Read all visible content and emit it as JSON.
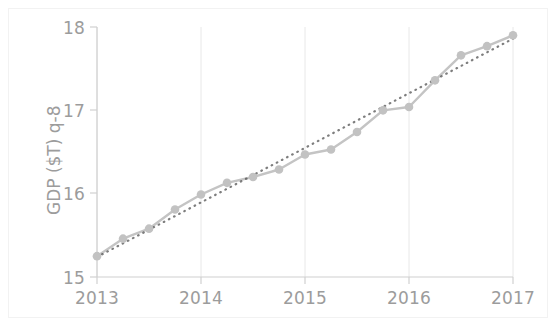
{
  "chart_data": {
    "type": "line",
    "title": "",
    "xlabel": "",
    "ylabel": "GDP ($T) q-8",
    "xlim": [
      2013.0,
      2017.0
    ],
    "ylim": [
      15.0,
      18.0
    ],
    "xticks": [
      "2013",
      "2014",
      "2015",
      "2016",
      "2017"
    ],
    "xtick_values": [
      2013,
      2014,
      2015,
      2016,
      2017
    ],
    "yticks": [
      "15",
      "16",
      "17",
      "18"
    ],
    "ytick_values": [
      15,
      16,
      17,
      18
    ],
    "grid": true,
    "grid_axis": "x",
    "legend": "none",
    "series": [
      {
        "name": "GDP",
        "style": "solid-line-with-markers",
        "color": "#c4c4c4",
        "marker": "circle",
        "x": [
          2013.0,
          2013.25,
          2013.5,
          2013.75,
          2014.0,
          2014.25,
          2014.5,
          2014.75,
          2015.0,
          2015.25,
          2015.5,
          2015.75,
          2016.0,
          2016.25,
          2016.5,
          2016.75,
          2017.0
        ],
        "values": [
          15.25,
          15.46,
          15.58,
          15.81,
          15.99,
          16.13,
          16.2,
          16.29,
          16.47,
          16.53,
          16.74,
          17.0,
          17.04,
          17.36,
          17.66,
          17.77,
          17.9
        ]
      },
      {
        "name": "Trend",
        "style": "dotted-line",
        "color": "#4d4d4d",
        "marker": "none",
        "x": [
          2013.0,
          2017.0
        ],
        "values": [
          15.24,
          17.86
        ]
      }
    ]
  },
  "axis": {
    "y_label": "GDP ($T) q-8",
    "y_tick_labels": [
      "18",
      "17",
      "16",
      "15"
    ],
    "x_tick_labels": [
      "2013",
      "2014",
      "2015",
      "2016",
      "2017"
    ]
  },
  "colors": {
    "series_line": "#c4c4c4",
    "marker_fill": "#c2c2c2",
    "trend_line": "#4d4d4d",
    "gridline": "#e8e8e8",
    "spine": "#d0d0d0",
    "tick_text": "#9c9c9c",
    "figure_border": "#f2f2f2",
    "background": "#ffffff"
  }
}
